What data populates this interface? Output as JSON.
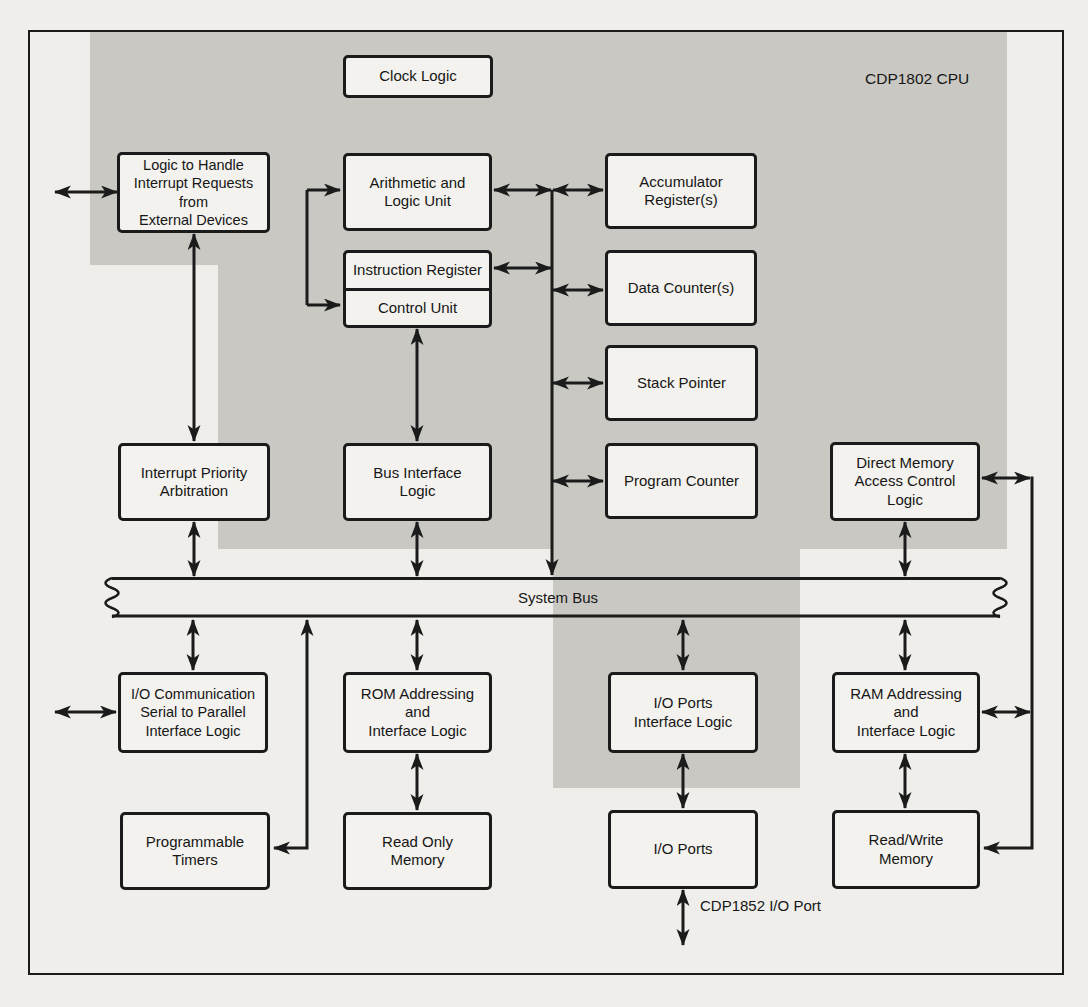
{
  "diagram_title": "CDP1802 CPU block diagram",
  "labels": {
    "cpu": "CDP1802 CPU",
    "bus": "System Bus",
    "io_port_chip": "CDP1852 I/O Port"
  },
  "colors": {
    "chip_shade": "#c9c8c3",
    "paper": "#efeeea",
    "line": "#1b1b1b"
  },
  "boxes": {
    "clock": {
      "label": "Clock Logic"
    },
    "irq": {
      "label": "Logic to Handle\nInterrupt Requests\nfrom\nExternal Devices"
    },
    "alu": {
      "label": "Arithmetic and\nLogic Unit"
    },
    "acc": {
      "label": "Accumulator\nRegister(s)"
    },
    "ir": {
      "label": "Instruction Register"
    },
    "cu": {
      "label": "Control Unit"
    },
    "dc": {
      "label": "Data Counter(s)"
    },
    "sp": {
      "label": "Stack Pointer"
    },
    "pc": {
      "label": "Program Counter"
    },
    "ipa": {
      "label": "Interrupt Priority\nArbitration"
    },
    "bil": {
      "label": "Bus Interface\nLogic"
    },
    "dma": {
      "label": "Direct Memory\nAccess Control\nLogic"
    },
    "iocomm": {
      "label": "I/O Communication\nSerial to Parallel\nInterface Logic"
    },
    "romaddr": {
      "label": "ROM Addressing\nand\nInterface Logic"
    },
    "ioportsif": {
      "label": "I/O Ports\nInterface Logic"
    },
    "ramaddr": {
      "label": "RAM Addressing\nand\nInterface Logic"
    },
    "timers": {
      "label": "Programmable\nTimers"
    },
    "rom": {
      "label": "Read Only\nMemory"
    },
    "ioports": {
      "label": "I/O Ports"
    },
    "rwmem": {
      "label": "Read/Write\nMemory"
    }
  }
}
